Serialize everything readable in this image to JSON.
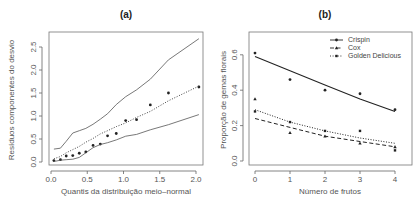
{
  "chart_data": [
    {
      "id": "a",
      "type": "line",
      "title": "(a)",
      "xlabel": "Quantis da distribuição meio–normal",
      "ylabel": "Resíduos componentes do desvio",
      "xlim": [
        0.0,
        2.1
      ],
      "ylim": [
        0.0,
        2.8
      ],
      "xticks": [
        0.0,
        0.5,
        1.0,
        1.5,
        2.0
      ],
      "xtick_labels": [
        "0.0",
        "0.5",
        "1.0",
        "1.5",
        "2.0"
      ],
      "yticks": [
        0.0,
        0.5,
        1.0,
        1.5,
        2.0,
        2.5
      ],
      "ytick_labels": [
        "0.0",
        "0.5",
        "1.0",
        "1.5",
        "2.0",
        "2.5"
      ],
      "grid": false,
      "legend": null,
      "series": [
        {
          "name": "Resíduos observados",
          "style": "points",
          "x": [
            0.04,
            0.13,
            0.21,
            0.3,
            0.39,
            0.48,
            0.58,
            0.68,
            0.78,
            0.9,
            1.03,
            1.18,
            1.37,
            1.62,
            2.04
          ],
          "y": [
            0.03,
            0.05,
            0.13,
            0.14,
            0.19,
            0.22,
            0.36,
            0.39,
            0.57,
            0.62,
            0.9,
            0.92,
            1.24,
            1.5,
            1.63
          ]
        },
        {
          "name": "Envelope superior",
          "style": "solid",
          "x": [
            0.04,
            0.13,
            0.21,
            0.3,
            0.39,
            0.48,
            0.58,
            0.68,
            0.78,
            0.9,
            1.03,
            1.18,
            1.37,
            1.62,
            2.04
          ],
          "y": [
            0.28,
            0.3,
            0.45,
            0.63,
            0.68,
            0.73,
            0.82,
            0.93,
            1.05,
            1.25,
            1.42,
            1.57,
            1.8,
            2.22,
            2.68
          ]
        },
        {
          "name": "Mediana",
          "style": "dotted",
          "x": [
            0.04,
            0.13,
            0.21,
            0.3,
            0.39,
            0.48,
            0.58,
            0.68,
            0.78,
            0.9,
            1.03,
            1.18,
            1.37,
            1.62,
            2.04
          ],
          "y": [
            0.07,
            0.12,
            0.2,
            0.27,
            0.34,
            0.43,
            0.51,
            0.61,
            0.68,
            0.77,
            0.85,
            0.97,
            1.1,
            1.33,
            1.65
          ]
        },
        {
          "name": "Envelope inferior",
          "style": "solid",
          "x": [
            0.04,
            0.13,
            0.21,
            0.3,
            0.39,
            0.48,
            0.58,
            0.68,
            0.78,
            0.9,
            1.03,
            1.18,
            1.37,
            1.62,
            2.04
          ],
          "y": [
            0.01,
            0.04,
            0.05,
            0.06,
            0.1,
            0.2,
            0.31,
            0.38,
            0.42,
            0.48,
            0.56,
            0.6,
            0.7,
            0.81,
            1.03
          ]
        }
      ]
    },
    {
      "id": "b",
      "type": "line",
      "title": "(b)",
      "xlabel": "Número de frutos",
      "ylabel": "Proporção de gemas florais",
      "xlim": [
        -0.15,
        4.15
      ],
      "ylim": [
        -0.02,
        0.72
      ],
      "xticks": [
        0,
        1,
        2,
        3,
        4
      ],
      "xtick_labels": [
        "0",
        "1",
        "2",
        "3",
        "4"
      ],
      "yticks": [
        0.0,
        0.2,
        0.4,
        0.6
      ],
      "ytick_labels": [
        "0.0",
        "0.2",
        "0.4",
        "0.6"
      ],
      "grid": false,
      "legend": {
        "position": "top-right",
        "entries": [
          {
            "label": "Crispin",
            "line": "solid",
            "marker": "circle"
          },
          {
            "label": "Cox",
            "line": "dashed",
            "marker": "triangle"
          },
          {
            "label": "Golden Delicious",
            "line": "dotted",
            "marker": "plus"
          }
        ]
      },
      "series": [
        {
          "name": "Crispin",
          "line": "solid",
          "points_x": [
            0,
            1,
            2,
            3,
            4
          ],
          "points_y": [
            0.61,
            0.46,
            0.4,
            0.38,
            0.29
          ],
          "fit_x": [
            0,
            1,
            2,
            3,
            4
          ],
          "fit_y": [
            0.59,
            0.51,
            0.43,
            0.35,
            0.28
          ]
        },
        {
          "name": "Cox",
          "line": "dashed",
          "points_x": [
            0,
            1,
            2,
            3,
            4
          ],
          "points_y": [
            0.35,
            0.16,
            0.14,
            0.1,
            0.08
          ],
          "fit_x": [
            0,
            1,
            2,
            3,
            4
          ],
          "fit_y": [
            0.24,
            0.19,
            0.14,
            0.11,
            0.08
          ]
        },
        {
          "name": "Golden Delicious",
          "line": "dotted",
          "points_x": [
            0,
            1,
            2,
            3,
            4
          ],
          "points_y": [
            0.28,
            0.22,
            0.17,
            0.17,
            0.06
          ],
          "fit_x": [
            0,
            1,
            2,
            3,
            4
          ],
          "fit_y": [
            0.29,
            0.22,
            0.17,
            0.13,
            0.1
          ]
        }
      ]
    }
  ],
  "colors": {
    "ink": "#222222",
    "axis": "#666666",
    "envelope": "#555555",
    "background": "#ffffff"
  }
}
